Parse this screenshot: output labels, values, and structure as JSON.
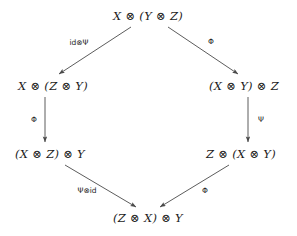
{
  "diagram": {
    "type": "commutative-diagram",
    "shape": "hexagon",
    "background_color": "#ffffff",
    "stroke_color": "#4a4a4a",
    "text_color": "#1a1a1a",
    "nodes": [
      {
        "id": "top",
        "label": "X ⊗ (Y ⊗ Z)",
        "x": 148,
        "y": 16
      },
      {
        "id": "middle-left",
        "label": "X ⊗ (Z ⊗ Y)",
        "x": 53,
        "y": 86
      },
      {
        "id": "middle-right",
        "label": "(X ⊗ Y) ⊗ Z",
        "x": 244,
        "y": 86
      },
      {
        "id": "lower-left",
        "label": "(X ⊗ Z) ⊗ Y",
        "x": 50,
        "y": 154
      },
      {
        "id": "lower-right",
        "label": "Z ⊗ (X ⊗ Y)",
        "x": 241,
        "y": 154
      },
      {
        "id": "bottom",
        "label": "(Z ⊗ X) ⊗ Y",
        "x": 148,
        "y": 218
      }
    ],
    "edges": [
      {
        "id": "top-to-middle-left",
        "from": "top",
        "to": "middle-left",
        "label": "id⊗Ψ",
        "label_x": 79,
        "label_y": 42,
        "x1": 131,
        "y1": 27,
        "x2": 59,
        "y2": 74
      },
      {
        "id": "top-to-middle-right",
        "from": "top",
        "to": "middle-right",
        "label": "Φ",
        "label_x": 211,
        "label_y": 41,
        "x1": 168,
        "y1": 27,
        "x2": 238,
        "y2": 74
      },
      {
        "id": "middle-left-to-lower-left",
        "from": "middle-left",
        "to": "lower-left",
        "label": "Φ",
        "label_x": 34,
        "label_y": 119,
        "x1": 45,
        "y1": 97,
        "x2": 45,
        "y2": 142
      },
      {
        "id": "middle-right-to-lower-right",
        "from": "middle-right",
        "to": "lower-right",
        "label": "Ψ",
        "label_x": 261,
        "label_y": 119,
        "x1": 248,
        "y1": 97,
        "x2": 248,
        "y2": 142
      },
      {
        "id": "lower-left-to-bottom",
        "from": "lower-left",
        "to": "bottom",
        "label": "Ψ⊗id",
        "label_x": 87,
        "label_y": 190,
        "x1": 65,
        "y1": 165,
        "x2": 136,
        "y2": 207
      },
      {
        "id": "lower-right-to-bottom",
        "from": "lower-right",
        "to": "bottom",
        "label": "Φ",
        "label_x": 205,
        "label_y": 190,
        "x1": 229,
        "y1": 165,
        "x2": 160,
        "y2": 207
      }
    ]
  }
}
